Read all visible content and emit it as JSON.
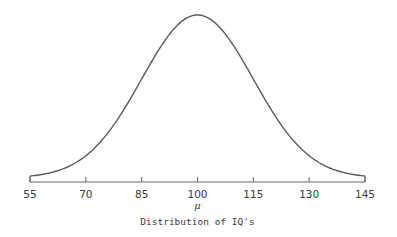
{
  "chart_data": {
    "type": "line",
    "title": "",
    "xlabel": "Distribution of IQ's",
    "ylabel": "",
    "center_marker": "μ",
    "distribution": "normal",
    "mean": 100,
    "std_dev": 15,
    "xlim": [
      55,
      145
    ],
    "x_ticks": [
      55,
      70,
      85,
      100,
      115,
      130,
      145
    ],
    "x_tick_labels": [
      "55",
      "70",
      "85",
      "100",
      "115",
      "130",
      "145"
    ],
    "grid": false,
    "legend": null,
    "series": [
      {
        "name": "IQ normal curve",
        "x": [
          55,
          60,
          65,
          70,
          75,
          80,
          85,
          90,
          95,
          100,
          105,
          110,
          115,
          120,
          125,
          130,
          135,
          140,
          145
        ],
        "relative_density": [
          0.011,
          0.029,
          0.066,
          0.135,
          0.249,
          0.411,
          0.607,
          0.801,
          0.946,
          1.0,
          0.946,
          0.801,
          0.607,
          0.411,
          0.249,
          0.135,
          0.066,
          0.029,
          0.011
        ]
      }
    ]
  },
  "axis": {
    "tick_labels": [
      "55",
      "70",
      "85",
      "100",
      "115",
      "130",
      "145"
    ],
    "mu": "μ",
    "caption": "Distribution of IQ's"
  },
  "colors": {
    "line": "#5a5a5a",
    "axis": "#6a6a6a",
    "text": "#3a3a3a",
    "background": "#ffffff"
  }
}
